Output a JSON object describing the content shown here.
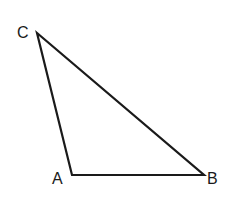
{
  "diagram": {
    "type": "triangle",
    "stroke_color": "#1a1a1a",
    "background": "#ffffff",
    "vertices": [
      {
        "label": "A",
        "x": 72,
        "y": 175,
        "label_x": 52,
        "label_y": 184
      },
      {
        "label": "B",
        "x": 204,
        "y": 175,
        "label_x": 207,
        "label_y": 184
      },
      {
        "label": "C",
        "x": 37,
        "y": 33,
        "label_x": 17,
        "label_y": 38
      }
    ],
    "edges": [
      {
        "from": "A",
        "to": "B"
      },
      {
        "from": "B",
        "to": "C"
      },
      {
        "from": "C",
        "to": "A"
      }
    ]
  }
}
